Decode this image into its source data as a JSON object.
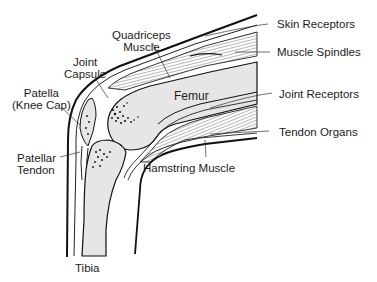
{
  "diagram": {
    "colors": {
      "ink": "#1a1a1a",
      "bone_fill": "#e6e6e6",
      "background": "#ffffff"
    },
    "labels": {
      "quadriceps": [
        "Quadriceps",
        "Muscle"
      ],
      "joint_capsule": [
        "Joint",
        "Capsule"
      ],
      "patella": [
        "Patella",
        "(Knee Cap)"
      ],
      "patellar_tendon": [
        "Patellar",
        "Tendon"
      ],
      "femur": "Femur",
      "tibia": "Tibia",
      "hamstring": "Hamstring Muscle",
      "skin_receptors": "Skin Receptors",
      "muscle_spindles": "Muscle Spindles",
      "joint_receptors": "Joint Receptors",
      "tendon_organs": "Tendon Organs"
    }
  }
}
